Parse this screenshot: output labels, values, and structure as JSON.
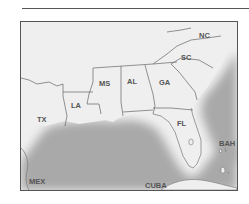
{
  "map": {
    "region": "Southeastern United States and Gulf of Mexico",
    "colors": {
      "land": "#efefef",
      "water": "#a8a8a8",
      "border": "#666666",
      "frame": "#555555"
    },
    "labels": {
      "nc": "NC",
      "sc": "SC",
      "ga": "GA",
      "al": "AL",
      "ms": "MS",
      "la": "LA",
      "tx": "TX",
      "fl": "FL",
      "bah": "BAH",
      "mex": "MEX",
      "cuba": "CUBA"
    }
  }
}
